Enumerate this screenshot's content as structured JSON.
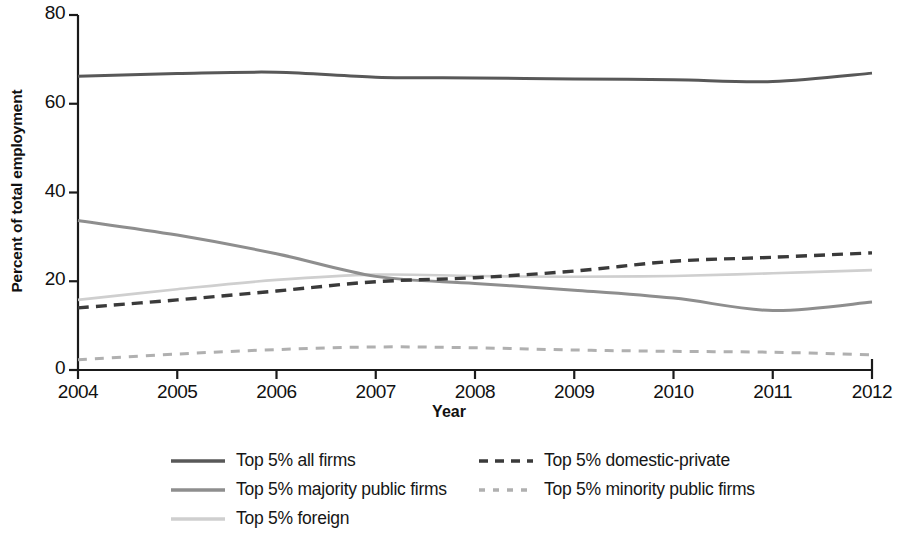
{
  "chart_data": {
    "type": "line",
    "title": "",
    "xlabel": "Year",
    "ylabel": "Percent of total employment",
    "x": [
      2004,
      2005,
      2006,
      2007,
      2008,
      2009,
      2010,
      2011,
      2012
    ],
    "xlim": [
      2004,
      2012
    ],
    "ylim": [
      0,
      80
    ],
    "y_ticks": [
      0,
      20,
      40,
      60,
      80
    ],
    "x_ticks": [
      2004,
      2005,
      2006,
      2007,
      2008,
      2009,
      2010,
      2011,
      2012
    ],
    "grid": false,
    "legend_position": "bottom",
    "series": [
      {
        "name": "Top 5% all firms",
        "style": "solid",
        "color": "#585858",
        "width": 3.0,
        "values": [
          66.2,
          66.8,
          67.1,
          66.0,
          65.8,
          65.6,
          65.4,
          65.0,
          66.9
        ]
      },
      {
        "name": "Top 5% domestic-private",
        "style": "dashed",
        "color": "#3a3a3a",
        "width": 3.4,
        "values": [
          14.0,
          15.8,
          17.8,
          19.9,
          20.8,
          22.3,
          24.5,
          25.4,
          26.4
        ]
      },
      {
        "name": "Top 5% majority public firms",
        "style": "solid",
        "color": "#8e8e8e",
        "width": 3.0,
        "values": [
          33.7,
          30.4,
          26.2,
          21.1,
          19.5,
          18.0,
          16.2,
          13.4,
          15.3
        ]
      },
      {
        "name": "Top 5% minority public firms",
        "style": "dashed",
        "color": "#b0b0b0",
        "width": 3.0,
        "values": [
          2.3,
          3.6,
          4.6,
          5.2,
          5.0,
          4.5,
          4.2,
          4.0,
          3.4
        ]
      },
      {
        "name": "Top 5% foreign",
        "style": "solid",
        "color": "#cfcfcf",
        "width": 2.6,
        "values": [
          15.8,
          18.2,
          20.3,
          21.5,
          21.2,
          21.0,
          21.2,
          21.8,
          22.5
        ]
      }
    ]
  },
  "axes": {
    "y_title": "Percent of total employment",
    "x_title": "Year",
    "y_tick_labels": [
      "0",
      "20",
      "40",
      "60",
      "80"
    ],
    "x_tick_labels": [
      "2004",
      "2005",
      "2006",
      "2007",
      "2008",
      "2009",
      "2010",
      "2011",
      "2012"
    ],
    "axis_color": "#1a1a1a"
  },
  "legend": {
    "left_column": [
      {
        "label": "Top 5% all firms",
        "series": 0
      },
      {
        "label": "Top 5% majority public firms",
        "series": 2
      },
      {
        "label": "Top 5% foreign",
        "series": 4
      }
    ],
    "right_column": [
      {
        "label": "Top 5% domestic-private",
        "series": 1
      },
      {
        "label": "Top 5% minority public firms",
        "series": 3
      }
    ]
  }
}
